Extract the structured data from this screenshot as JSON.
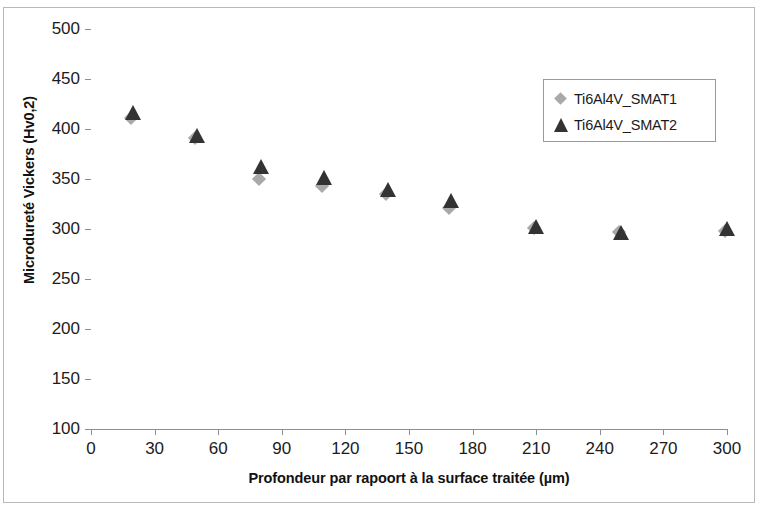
{
  "chart_data": {
    "type": "scatter",
    "title": "",
    "xlabel": "Profondeur par rapoort à la surface traitée (µm)",
    "ylabel": "Microdureté Vickers (Hv0,2)",
    "xlim": [
      0,
      300
    ],
    "ylim": [
      100,
      500
    ],
    "xticks": [
      0,
      30,
      60,
      90,
      120,
      150,
      180,
      210,
      240,
      270,
      300
    ],
    "yticks": [
      100,
      150,
      200,
      250,
      300,
      350,
      400,
      450,
      500
    ],
    "grid": false,
    "legend_position": "upper right",
    "x": [
      20,
      50,
      80,
      110,
      140,
      170,
      210,
      250,
      300
    ],
    "series": [
      {
        "name": "Ti6Al4V_SMAT1",
        "marker": "diamond",
        "color": "#a9a9a9",
        "values": [
          409,
          389,
          348,
          341,
          333,
          319,
          299,
          295,
          296
        ]
      },
      {
        "name": "Ti6Al4V_SMAT2",
        "marker": "triangle",
        "color": "#333333",
        "values": [
          416,
          393,
          362,
          351,
          339,
          328,
          302,
          296,
          300
        ]
      }
    ]
  },
  "axis": {
    "x_title": "Profondeur par rapoort à la surface traitée (µm)",
    "y_title": "Microdureté Vickers (Hv0,2)",
    "x_tick_labels": [
      "0",
      "30",
      "60",
      "90",
      "120",
      "150",
      "180",
      "210",
      "240",
      "270",
      "300"
    ],
    "y_tick_labels": [
      "100",
      "150",
      "200",
      "250",
      "300",
      "350",
      "400",
      "450",
      "500"
    ]
  },
  "legend": {
    "entries": [
      {
        "label": "Ti6Al4V_SMAT1",
        "marker": "diamond-icon"
      },
      {
        "label": "Ti6Al4V_SMAT2",
        "marker": "triangle-icon"
      }
    ]
  }
}
